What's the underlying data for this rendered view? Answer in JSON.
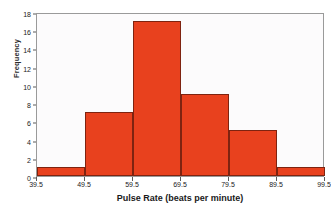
{
  "chart_data": {
    "type": "bar",
    "title": "",
    "xlabel": "Pulse Rate (beats per minute)",
    "ylabel": "Frequency",
    "categories": [
      "39.5-49.5",
      "49.5-59.5",
      "59.5-69.5",
      "69.5-79.5",
      "79.5-89.5",
      "89.5-99.5"
    ],
    "values": [
      1,
      7,
      17,
      9,
      5,
      1
    ],
    "bin_edges": [
      39.5,
      49.5,
      59.5,
      69.5,
      79.5,
      89.5,
      99.5
    ],
    "xlim": [
      39.5,
      99.5
    ],
    "ylim": [
      0,
      18
    ],
    "x_ticks": [
      "39.5",
      "49.5",
      "59.5",
      "69.5",
      "79.5",
      "89.5",
      "99.5"
    ],
    "x_tick_values": [
      39.5,
      49.5,
      59.5,
      69.5,
      79.5,
      89.5,
      99.5
    ],
    "y_ticks": [
      "0",
      "2",
      "4",
      "6",
      "8",
      "10",
      "12",
      "14",
      "16",
      "18"
    ],
    "y_tick_values": [
      0,
      2,
      4,
      6,
      8,
      10,
      12,
      14,
      16,
      18
    ],
    "grid": false,
    "legend": null,
    "bar_color": "#e8411e",
    "bar_edge_color": "#7e2310",
    "plot_background": "#fcfbfc",
    "frame_color": "#9a9a9a",
    "page_background": "#ffffff"
  }
}
